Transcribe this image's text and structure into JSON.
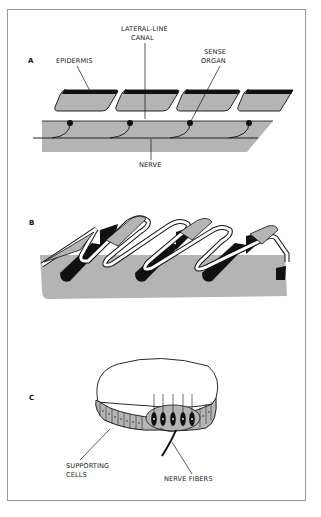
{
  "figure": {
    "panels": [
      {
        "id": "A",
        "label": "A",
        "callouts": {
          "epidermis": "EPIDERMIS",
          "canal_line1": "LATERAL-LINE",
          "canal_line2": "CANAL",
          "sense_line1": "SENSE",
          "sense_line2": "ORGAN",
          "nerve": "NERVE"
        }
      },
      {
        "id": "B",
        "label": "B"
      },
      {
        "id": "C",
        "label": "C",
        "callouts": {
          "supporting_line1": "SUPPORTING",
          "supporting_line2": "CELLS",
          "nerve_fibers": "NERVE FIBERS"
        }
      }
    ],
    "colors": {
      "tissue_gray": "#b4b4b4",
      "ink": "#111111",
      "frame": "#9a9a9a",
      "background": "#ffffff"
    }
  }
}
